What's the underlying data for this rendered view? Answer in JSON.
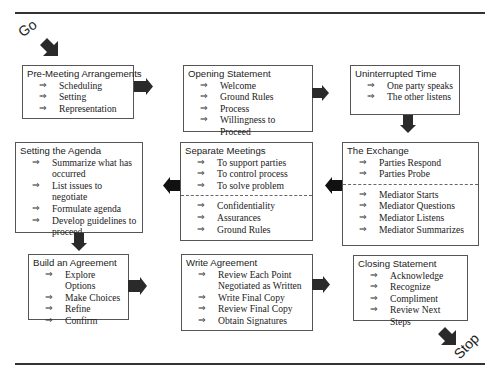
{
  "labels": {
    "start": "Go",
    "end": "Stop"
  },
  "colors": {
    "arrow": "#2a2a2a",
    "border": "#555555",
    "rule": "#333333"
  },
  "boxes": {
    "pre_meeting": {
      "title": "Pre-Meeting Arrangements",
      "items": [
        "Scheduling",
        "Setting",
        "Representation"
      ]
    },
    "opening": {
      "title": "Opening Statement",
      "items": [
        "Welcome",
        "Ground Rules",
        "Process",
        "Willingness to Proceed"
      ]
    },
    "uninterrupted": {
      "title": "Uninterrupted Time",
      "items": [
        "One party speaks",
        "The other listens"
      ]
    },
    "exchange": {
      "title": "The Exchange",
      "items_top": [
        "Parties Respond",
        "Parties Probe"
      ],
      "items_bottom": [
        "Mediator Starts",
        "Mediator Questions",
        "Mediator Listens",
        "Mediator Summarizes"
      ]
    },
    "separate": {
      "title": "Separate Meetings",
      "items_top": [
        "To support parties",
        "To control process",
        "To solve problem"
      ],
      "items_bottom": [
        "Confidentiality",
        "Assurances",
        "Ground Rules"
      ]
    },
    "agenda": {
      "title": "Setting the Agenda",
      "items": [
        "Summarize what has",
        "occurred",
        "List issues to negotiate",
        "Formulate agenda",
        "Develop guidelines to",
        "proceed"
      ]
    },
    "build": {
      "title": "Build an Agreement",
      "items": [
        "Explore Options",
        "Make Choices",
        "Refine",
        "Confirm"
      ]
    },
    "write": {
      "title": "Write Agreement",
      "items": [
        "Review Each Point",
        "Negotiated as Written",
        "Write Final Copy",
        "Review Final Copy",
        "Obtain Signatures"
      ]
    },
    "closing": {
      "title": "Closing Statement",
      "items": [
        "Acknowledge",
        "Recognize",
        "Compliment",
        "Review Next Steps"
      ]
    }
  },
  "bullet_glyph": "⇒"
}
